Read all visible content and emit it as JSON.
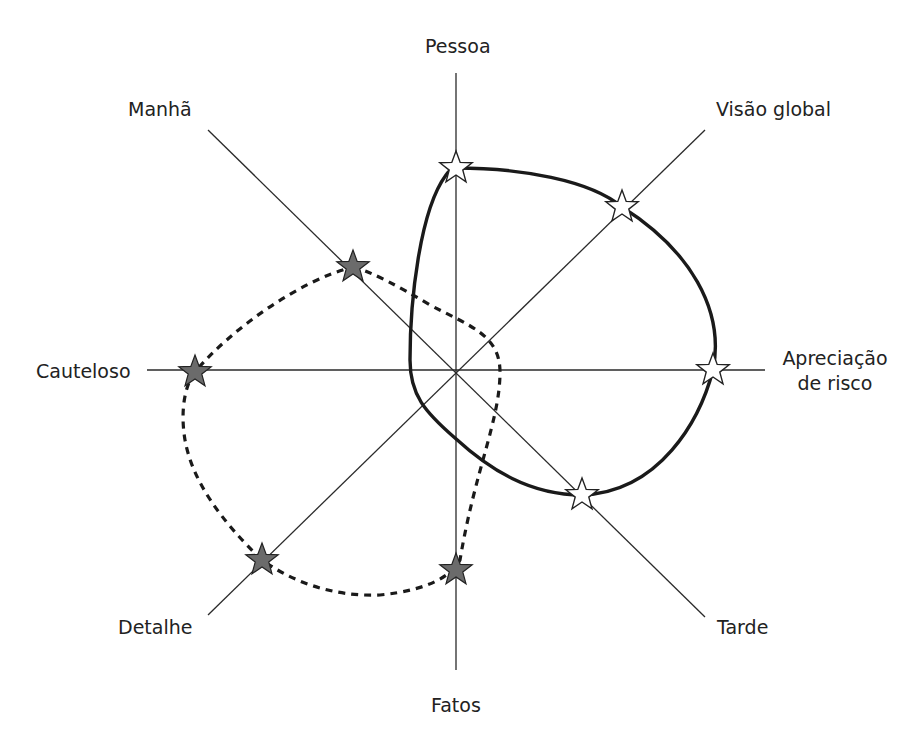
{
  "diagram": {
    "type": "eight-axis profile diagram",
    "center": [
      456,
      370
    ],
    "colors": {
      "axis": "#2a2a2a",
      "solid_profile": "#1a1a1a",
      "dashed_profile": "#1a1a1a",
      "filled_star": "#6b6b6b",
      "hollow_star": "#ffffff",
      "star_stroke": "#222222",
      "background": "#ffffff"
    },
    "axes": [
      {
        "id": "pessoa",
        "label": "Pessoa",
        "end": [
          456,
          73
        ]
      },
      {
        "id": "fatos",
        "label": "Fatos",
        "end": [
          456,
          670
        ]
      },
      {
        "id": "cauteloso",
        "label": "Cauteloso",
        "end": [
          147,
          370
        ]
      },
      {
        "id": "apreciacao",
        "label_line1": "Apreciação",
        "label_line2": "de risco",
        "end": [
          765,
          370
        ]
      },
      {
        "id": "manha",
        "label": "Manhã",
        "end": [
          208,
          130
        ]
      },
      {
        "id": "tarde",
        "label": "Tarde",
        "end": [
          705,
          617
        ]
      },
      {
        "id": "detalhe",
        "label": "Detalhe",
        "end": [
          208,
          615
        ]
      },
      {
        "id": "visao",
        "label": "Visão global",
        "end": [
          705,
          130
        ]
      }
    ],
    "profiles": [
      {
        "name": "solid-profile",
        "style": "solid",
        "marker": "hollow-star",
        "points": [
          {
            "axis": "Pessoa",
            "x": 456,
            "y": 168
          },
          {
            "axis": "Visão global",
            "x": 622,
            "y": 207
          },
          {
            "axis": "Apreciação de risco",
            "x": 713,
            "y": 370
          },
          {
            "axis": "Tarde",
            "x": 582,
            "y": 495
          }
        ]
      },
      {
        "name": "dashed-profile",
        "style": "dashed",
        "marker": "filled-star",
        "points": [
          {
            "axis": "Manhã",
            "x": 353,
            "y": 267
          },
          {
            "axis": "Cauteloso",
            "x": 195,
            "y": 372
          },
          {
            "axis": "Detalhe",
            "x": 262,
            "y": 560
          },
          {
            "axis": "Fatos",
            "x": 456,
            "y": 570
          }
        ]
      }
    ]
  },
  "labels": {
    "pessoa": "Pessoa",
    "fatos": "Fatos",
    "cauteloso": "Cauteloso",
    "apreciacao_line1": "Apreciação",
    "apreciacao_line2": "de risco",
    "manha": "Manhã",
    "tarde": "Tarde",
    "detalhe": "Detalhe",
    "visao": "Visão global"
  }
}
